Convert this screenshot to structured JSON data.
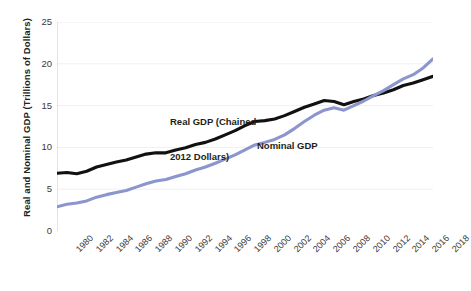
{
  "chart_data": {
    "type": "line",
    "title": "",
    "subtitle": "",
    "xlabel": "",
    "ylabel": "Real and Nominal GDP (Trillions of Dollars)",
    "xlim": [
      1980,
      2018
    ],
    "ylim": [
      0,
      25
    ],
    "yticks": [
      0,
      5,
      10,
      15,
      20,
      25
    ],
    "ytick_labels": [
      "0",
      "5",
      "10",
      "15",
      "20",
      "25"
    ],
    "xticks": [
      1980,
      1982,
      1984,
      1986,
      1988,
      1990,
      1992,
      1994,
      1996,
      1998,
      2000,
      2002,
      2004,
      2006,
      2008,
      2010,
      2012,
      2014,
      2016,
      2018
    ],
    "xtick_labels": [
      "1980",
      "1982",
      "1984",
      "1986",
      "1988",
      "1990",
      "1992",
      "1994",
      "1996",
      "1998",
      "2000",
      "2002",
      "2004",
      "2006",
      "2008",
      "2010",
      "2012",
      "2014",
      "2016",
      "2018"
    ],
    "grid": "horizontal-faint",
    "legend_position": "inline-annotations",
    "x": [
      1980,
      1981,
      1982,
      1983,
      1984,
      1985,
      1986,
      1987,
      1988,
      1989,
      1990,
      1991,
      1992,
      1993,
      1994,
      1995,
      1996,
      1997,
      1998,
      1999,
      2000,
      2001,
      2002,
      2003,
      2004,
      2005,
      2006,
      2007,
      2008,
      2009,
      2010,
      2011,
      2012,
      2013,
      2014,
      2015,
      2016,
      2017,
      2018
    ],
    "series": [
      {
        "name": "Real GDP (Chained 2012 Dollars)",
        "color": "#111111",
        "values": [
          6.9,
          7.0,
          6.85,
          7.15,
          7.65,
          7.95,
          8.25,
          8.5,
          8.85,
          9.2,
          9.35,
          9.35,
          9.7,
          9.95,
          10.35,
          10.6,
          11.0,
          11.5,
          12.0,
          12.6,
          13.1,
          13.2,
          13.4,
          13.8,
          14.3,
          14.8,
          15.2,
          15.6,
          15.5,
          15.1,
          15.5,
          15.8,
          16.2,
          16.5,
          16.9,
          17.4,
          17.7,
          18.1,
          18.5
        ]
      },
      {
        "name": "Nominal GDP",
        "color": "#8b95ce",
        "values": [
          2.9,
          3.2,
          3.35,
          3.6,
          4.05,
          4.35,
          4.6,
          4.85,
          5.25,
          5.65,
          5.98,
          6.15,
          6.52,
          6.85,
          7.3,
          7.65,
          8.1,
          8.6,
          9.1,
          9.7,
          10.3,
          10.6,
          10.95,
          11.5,
          12.25,
          13.1,
          13.85,
          14.45,
          14.75,
          14.45,
          15.0,
          15.55,
          16.2,
          16.8,
          17.5,
          18.2,
          18.7,
          19.5,
          20.6
        ]
      }
    ],
    "annotations": [
      {
        "text": "Real GDP (Chained",
        "text2": "2012 Dollars)",
        "series": "Real GDP (Chained 2012 Dollars)"
      },
      {
        "text": "Nominal GDP",
        "series": "Nominal GDP"
      }
    ]
  }
}
